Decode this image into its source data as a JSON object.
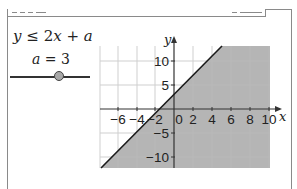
{
  "titlebar": {
    "left_decoration": "dashes",
    "right_decoration": "dash-pair"
  },
  "formula": {
    "lhs": "y",
    "relation": "≤",
    "rhs": "2x + a",
    "full": "y ≤ 2x + a"
  },
  "slider": {
    "variable": "a",
    "value": 3,
    "label": "a = 3",
    "position_fraction": 0.61
  },
  "graph": {
    "x_axis_label": "x",
    "y_axis_label": "y",
    "x_ticks": [
      "−6",
      "−4",
      "−2",
      "0",
      "2",
      "4",
      "6",
      "8",
      "10"
    ],
    "y_ticks": [
      "10",
      "5",
      "−5",
      "−10"
    ],
    "origin_label": "0",
    "boundary_line": "y = 2x + 3",
    "shaded_region": "y ≤ 2x + 3",
    "colors": {
      "shade": "#b4b4b4",
      "grid": "#c8c8c8",
      "line": "#1a1a1a",
      "axis": "#333333"
    }
  }
}
